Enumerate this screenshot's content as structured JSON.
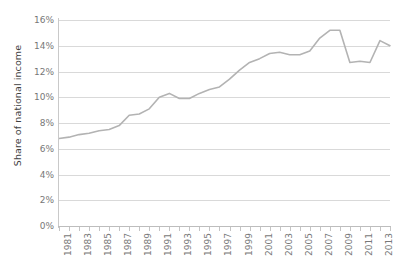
{
  "chart_data": {
    "type": "line",
    "title": "",
    "xlabel": "",
    "ylabel": "Share of national income",
    "ylim": [
      0,
      16
    ],
    "ytick_labels": [
      "0%",
      "2%",
      "4%",
      "6%",
      "8%",
      "10%",
      "12%",
      "14%",
      "16%"
    ],
    "ytick_values": [
      0,
      2,
      4,
      6,
      8,
      10,
      12,
      14,
      16
    ],
    "xlim": [
      1981,
      2014
    ],
    "grid": true,
    "legend": "none",
    "line_color": "#b3b3b3",
    "x": [
      1981,
      1982,
      1983,
      1984,
      1985,
      1986,
      1987,
      1988,
      1989,
      1990,
      1991,
      1992,
      1993,
      1994,
      1995,
      1996,
      1997,
      1998,
      1999,
      2000,
      2001,
      2002,
      2003,
      2004,
      2005,
      2006,
      2007,
      2008,
      2009,
      2010,
      2011,
      2012,
      2013,
      2014
    ],
    "xtick_labels": [
      "1981",
      "1983",
      "1985",
      "1987",
      "1989",
      "1991",
      "1993",
      "1995",
      "1997",
      "1999",
      "2001",
      "2003",
      "2005",
      "2007",
      "2009",
      "2011",
      "2013"
    ],
    "values": [
      6.8,
      6.9,
      7.1,
      7.2,
      7.4,
      7.5,
      7.8,
      8.6,
      8.7,
      9.1,
      10.0,
      10.3,
      9.9,
      9.9,
      10.3,
      10.6,
      10.8,
      11.4,
      12.1,
      12.7,
      13.0,
      13.4,
      13.5,
      13.3,
      13.3,
      13.6,
      14.6,
      15.2,
      15.2,
      12.7,
      12.8,
      12.7,
      14.4,
      14.0
    ],
    "series": [
      {
        "name": "Share of national income",
        "values": [
          6.8,
          6.9,
          7.1,
          7.2,
          7.4,
          7.5,
          7.8,
          8.6,
          8.7,
          9.1,
          10.0,
          10.3,
          9.9,
          9.9,
          10.3,
          10.6,
          10.8,
          11.4,
          12.1,
          12.7,
          13.0,
          13.4,
          13.5,
          13.3,
          13.3,
          13.6,
          14.6,
          15.2,
          15.2,
          12.7,
          12.8,
          12.7,
          14.4,
          14.0
        ]
      }
    ]
  }
}
